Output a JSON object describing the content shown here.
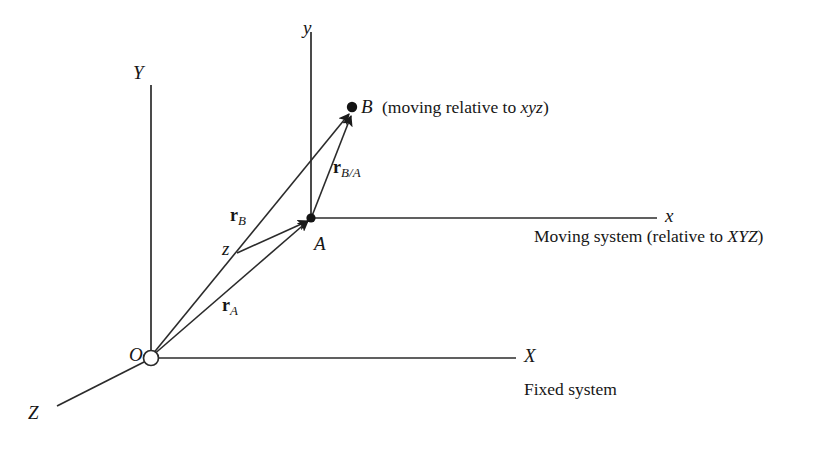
{
  "figure": {
    "name": "relative-motion-reference-frames-diagram",
    "background_color": "#ffffff",
    "line_color": "#2b2b2b",
    "text_color": "#161616"
  },
  "fixed_frame": {
    "origin_label": "O",
    "axis_x_label": "X",
    "axis_y_label": "Y",
    "axis_z_label": "Z",
    "caption": "Fixed system"
  },
  "moving_frame": {
    "origin_label": "A",
    "axis_x_label": "x",
    "axis_y_label": "y",
    "axis_z_label": "z",
    "caption_plain_1": "Moving system (relative to ",
    "caption_italic": "XYZ",
    "caption_plain_2": ")"
  },
  "points": {
    "b_label": "B",
    "b_caption_plain_1": "(moving relative to ",
    "b_caption_italic": "xyz",
    "b_caption_plain_2": ")"
  },
  "vectors": {
    "r_symbol": "r",
    "r_a_subscript": "A",
    "r_b_subscript": "B",
    "r_ba_subscript": "B/A"
  }
}
